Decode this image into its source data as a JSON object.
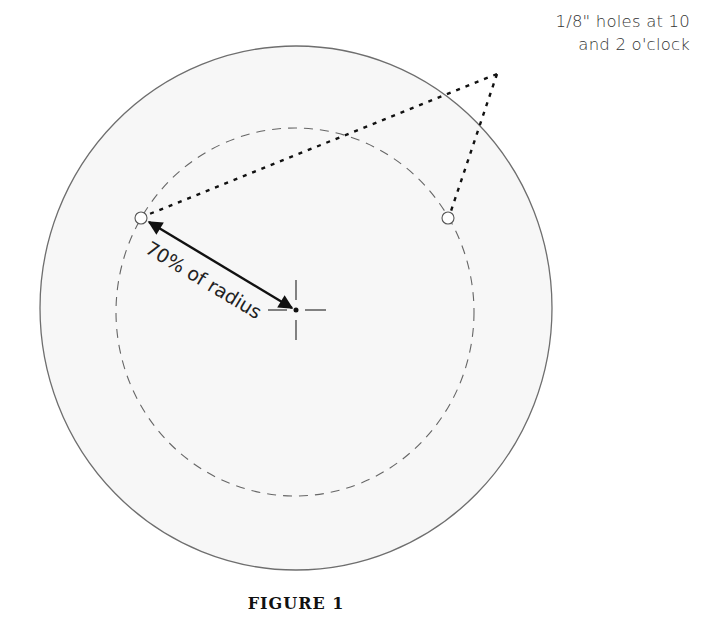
{
  "figure": {
    "caption": "FIGURE 1",
    "callout_line1": "1/8\" holes at 10",
    "callout_line2": "and 2 o'clock",
    "dimension_label": "70% of radius"
  },
  "geometry": {
    "outer_circle": {
      "cx": 296,
      "cy": 308,
      "rx": 256,
      "ry": 262
    },
    "bolt_circle_dashed": {
      "cx": 295,
      "cy": 312,
      "rx": 179,
      "ry": 184
    },
    "holes": [
      {
        "position": "10 o'clock",
        "cx": 141,
        "cy": 218,
        "r": 6
      },
      {
        "position": "2 o'clock",
        "cx": 448,
        "cy": 218,
        "r": 6
      }
    ],
    "center_mark": {
      "x": 296,
      "y": 310
    },
    "callout_apex": {
      "x": 497,
      "y": 74
    }
  },
  "colors": {
    "outline": "#6e6e6e",
    "fill": "#f7f7f7",
    "leader": "#111111",
    "text": "#333333"
  }
}
